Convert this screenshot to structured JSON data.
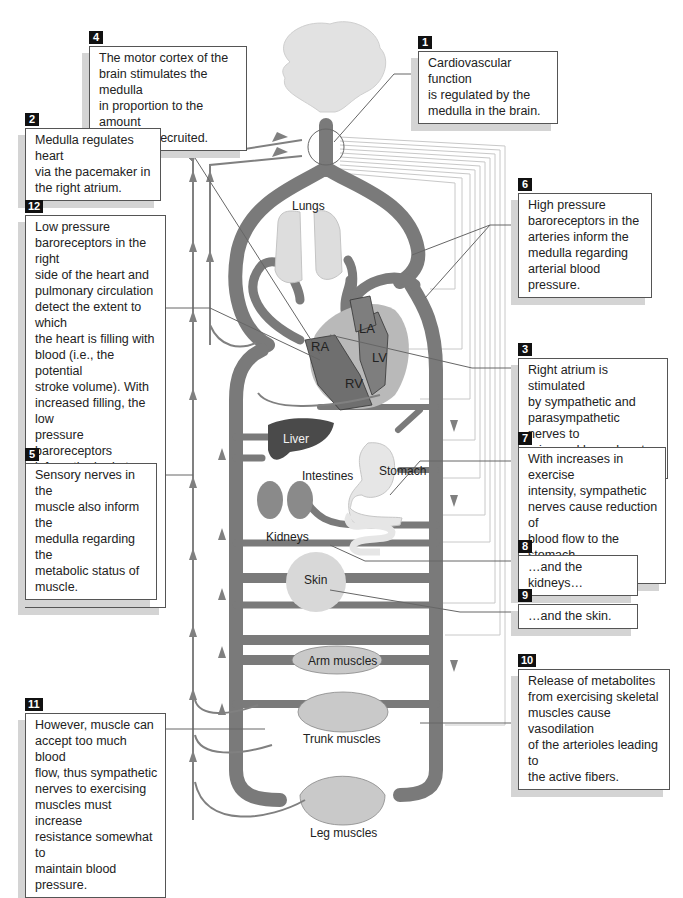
{
  "figure": {
    "colors": {
      "vessel": "#7a7a7a",
      "vessel_dark": "#5e5e5e",
      "nerve_line": "#6f6f6f",
      "arrow": "#808080",
      "organ_light": "#dcdcdc",
      "liver": "#4a4a4a",
      "kidney": "#8a8a8a",
      "heart_outer": "#b9b9b9",
      "heart_chamber": "#7e7e7e",
      "callout_number_bg": "#111111",
      "shadow": "#d4d4d4"
    }
  },
  "organ_labels": {
    "lungs": "Lungs",
    "la": "LA",
    "ra": "RA",
    "lv": "LV",
    "rv": "RV",
    "liver": "Liver",
    "intestines": "Intestines",
    "stomach": "Stomach",
    "kidneys": "Kidneys",
    "skin": "Skin",
    "arm_muscles": "Arm muscles",
    "trunk_muscles": "Trunk muscles",
    "leg_muscles": "Leg muscles"
  },
  "callouts": [
    {
      "id": "1",
      "number": "1",
      "lines": [
        "Cardiovascular function",
        "is regulated by the",
        "medulla in the brain."
      ]
    },
    {
      "id": "2",
      "number": "2",
      "lines": [
        "Medulla regulates heart",
        "via the pacemaker in",
        "the right atrium."
      ]
    },
    {
      "id": "3",
      "number": "3",
      "lines": [
        "Right atrium is stimulated",
        "by sympathetic and",
        "parasympathetic nerves to",
        "raise and lower heart rate."
      ]
    },
    {
      "id": "4",
      "number": "4",
      "lines": [
        "The motor cortex of the",
        "brain stimulates the medulla",
        "in proportion to the amount",
        "of muscle recruited."
      ]
    },
    {
      "id": "5",
      "number": "5",
      "lines": [
        "Sensory nerves in the",
        "muscle also inform the",
        "medulla regarding the",
        "metabolic status of",
        "muscle."
      ]
    },
    {
      "id": "6",
      "number": "6",
      "lines": [
        "High pressure",
        "baroreceptors in the",
        "arteries inform the",
        "medulla regarding",
        "arterial blood pressure."
      ]
    },
    {
      "id": "7",
      "number": "7",
      "lines": [
        "With increases in exercise",
        "intensity, sympathetic",
        "nerves cause reduction of",
        "blood flow to the stomach",
        "and intestines…"
      ]
    },
    {
      "id": "8",
      "number": "8",
      "lines": [
        "…and the kidneys…"
      ]
    },
    {
      "id": "9",
      "number": "9",
      "lines": [
        "…and the skin."
      ]
    },
    {
      "id": "10",
      "number": "10",
      "lines": [
        "Release of metabolites",
        "from exercising skeletal",
        "muscles cause vasodilation",
        "of the arterioles leading to",
        "the active fibers."
      ]
    },
    {
      "id": "11",
      "number": "11",
      "lines": [
        "However, muscle can",
        "accept too much blood",
        "flow, thus sympathetic",
        "nerves to exercising",
        "muscles must increase",
        "resistance somewhat to",
        "maintain blood pressure."
      ]
    },
    {
      "id": "12",
      "number": "12",
      "lines": [
        "Low pressure",
        "baroreceptors in the right",
        "side of the heart and",
        "pulmonary circulation",
        "detect the extent to which",
        "the heart is filling with",
        "blood (i.e., the potential",
        "stroke volume). With",
        "increased filling, the low",
        "pressure baroreceptors",
        "inform the brain to lower",
        "resistance to exercising",
        "skeletal muscles (#11);",
        "thus, arterial pressure is",
        "maintained."
      ]
    }
  ]
}
